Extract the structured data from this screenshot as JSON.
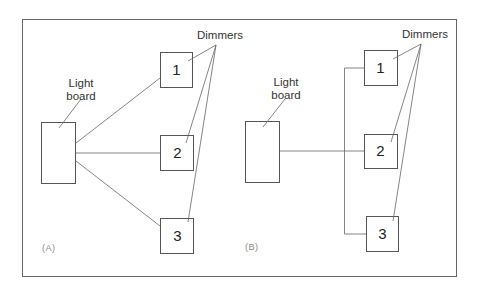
{
  "diagram": {
    "panels": [
      {
        "id": "A",
        "tag": "(A)",
        "light_board_label_line1": "Light",
        "light_board_label_line2": "board",
        "dimmers_label": "Dimmers",
        "dimmers": [
          "1",
          "2",
          "3"
        ],
        "wiring": "radial (each dimmer wired directly from light board)"
      },
      {
        "id": "B",
        "tag": "(B)",
        "light_board_label_line1": "Light",
        "light_board_label_line2": "board",
        "dimmers_label": "Dimmers",
        "dimmers": [
          "1",
          "2",
          "3"
        ],
        "wiring": "bus (single line from light board to shared vertical bus feeding all dimmers)"
      }
    ],
    "colors": {
      "line": "#555555",
      "frame": "#666666",
      "tag": "#8a8a8a"
    }
  }
}
